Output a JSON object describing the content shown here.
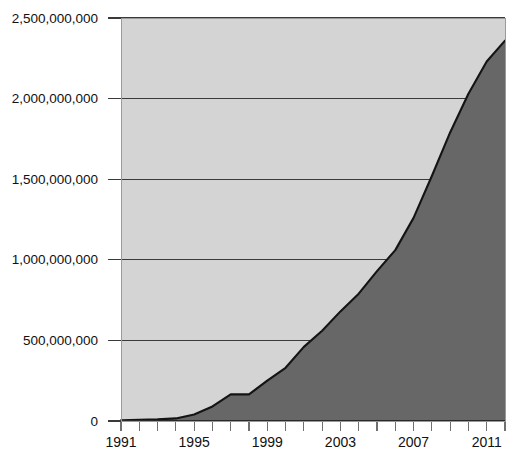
{
  "chart_data": {
    "type": "area",
    "title": "",
    "subtitle": "",
    "xlabel": "",
    "ylabel": "",
    "x": [
      1991,
      1992,
      1993,
      1994,
      1995,
      1996,
      1997,
      1998,
      1999,
      2000,
      2001,
      2002,
      2003,
      2004,
      2005,
      2006,
      2007,
      2008,
      2009,
      2010,
      2011,
      2012
    ],
    "values": [
      5000000,
      7000000,
      10000000,
      16000000,
      40000000,
      90000000,
      165000000,
      165000000,
      250000000,
      330000000,
      460000000,
      560000000,
      680000000,
      790000000,
      930000000,
      1060000000,
      1260000000,
      1520000000,
      1790000000,
      2030000000,
      2230000000,
      2360000000
    ],
    "series": [
      {
        "name": "Series 1",
        "values": [
          5000000,
          7000000,
          10000000,
          16000000,
          40000000,
          90000000,
          165000000,
          165000000,
          250000000,
          330000000,
          460000000,
          560000000,
          680000000,
          790000000,
          930000000,
          1060000000,
          1260000000,
          1520000000,
          1790000000,
          2030000000,
          2230000000,
          2360000000
        ]
      }
    ],
    "xlim": [
      1991,
      2012
    ],
    "ylim": [
      0,
      2500000000
    ],
    "grid": true,
    "legend": "none",
    "colors": {
      "plot_background": "#d4d4d4",
      "area_fill": "#676767",
      "line": "#141414",
      "gridline": "#3a3a3a",
      "page_background": "#ffffff"
    },
    "y_ticks": [
      {
        "value": 0,
        "label": "0"
      },
      {
        "value": 500000000,
        "label": "500,000,000"
      },
      {
        "value": 1000000000,
        "label": "1,000,000,000"
      },
      {
        "value": 1500000000,
        "label": "1,500,000,000"
      },
      {
        "value": 2000000000,
        "label": "2,000,000,000"
      },
      {
        "value": 2500000000,
        "label": "2,500,000,000"
      }
    ],
    "x_ticks": [
      {
        "value": 1991,
        "label": "1991"
      },
      {
        "value": 1992,
        "label": ""
      },
      {
        "value": 1993,
        "label": ""
      },
      {
        "value": 1994,
        "label": ""
      },
      {
        "value": 1995,
        "label": "1995"
      },
      {
        "value": 1996,
        "label": ""
      },
      {
        "value": 1997,
        "label": ""
      },
      {
        "value": 1998,
        "label": ""
      },
      {
        "value": 1999,
        "label": "1999"
      },
      {
        "value": 2000,
        "label": ""
      },
      {
        "value": 2001,
        "label": ""
      },
      {
        "value": 2002,
        "label": ""
      },
      {
        "value": 2003,
        "label": "2003"
      },
      {
        "value": 2004,
        "label": ""
      },
      {
        "value": 2005,
        "label": ""
      },
      {
        "value": 2006,
        "label": ""
      },
      {
        "value": 2007,
        "label": "2007"
      },
      {
        "value": 2008,
        "label": ""
      },
      {
        "value": 2009,
        "label": ""
      },
      {
        "value": 2010,
        "label": ""
      },
      {
        "value": 2011,
        "label": "2011"
      },
      {
        "value": 2012,
        "label": ""
      }
    ]
  },
  "layout": {
    "plot_left": 121,
    "plot_right": 505,
    "plot_top": 18,
    "plot_bottom": 421,
    "tick_length": 9,
    "label_gap": 10,
    "ystub_length": 13
  }
}
